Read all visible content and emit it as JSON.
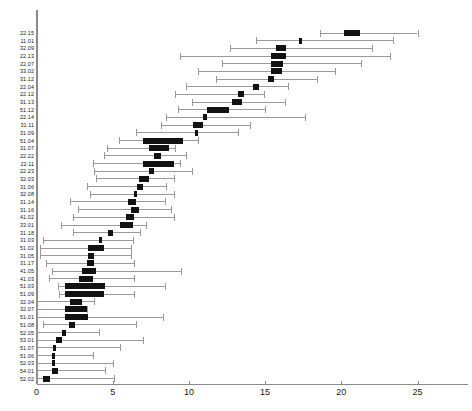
{
  "chart_data": {
    "type": "box",
    "title": "",
    "xlabel": "",
    "ylabel": "",
    "xlim": [
      0,
      28
    ],
    "xticks": [
      0,
      5,
      10,
      15,
      20,
      25
    ],
    "xtick_labels": [
      "0",
      "5",
      "10",
      "15",
      "20",
      "25"
    ],
    "grid": false,
    "legend": "none",
    "orientation": "horizontal",
    "n_groups": 45,
    "categories": [
      "22.15",
      "11.01",
      "32.09",
      "22.13",
      "22.07",
      "33.02",
      "31.12",
      "22.04",
      "22.12",
      "31.13",
      "51.12",
      "22.14",
      "31.11",
      "31.09",
      "51.04",
      "31.07",
      "22.22",
      "22.11",
      "22.23",
      "32.03",
      "31.06",
      "32.08",
      "31.14",
      "31.16",
      "41.02",
      "33.01",
      "31.18",
      "31.03",
      "51.02",
      "31.05",
      "31.17",
      "41.05",
      "41.03",
      "51.03",
      "51.09",
      "32.04",
      "32.07",
      "51.01",
      "51.08",
      "52.05",
      "53.01",
      "51.07",
      "51.06",
      "52.03",
      "54.01",
      "52.02"
    ],
    "boxes": [
      {
        "label": "22.15",
        "whisker_low": 18.6,
        "q1": 20.2,
        "median": 20.7,
        "q3": 21.2,
        "whisker_high": 25.0
      },
      {
        "label": "11.01",
        "whisker_low": 14.4,
        "q1": 17.2,
        "median": 17.3,
        "q3": 17.4,
        "whisker_high": 23.4
      },
      {
        "label": "32.09",
        "whisker_low": 12.7,
        "q1": 15.7,
        "median": 16.0,
        "q3": 16.4,
        "whisker_high": 22.0
      },
      {
        "label": "22.13",
        "whisker_low": 9.4,
        "q1": 15.4,
        "median": 15.9,
        "q3": 16.4,
        "whisker_high": 23.2
      },
      {
        "label": "22.07",
        "whisker_low": 12.2,
        "q1": 15.4,
        "median": 15.8,
        "q3": 16.2,
        "whisker_high": 21.3
      },
      {
        "label": "33.02",
        "whisker_low": 10.6,
        "q1": 15.4,
        "median": 15.7,
        "q3": 16.1,
        "whisker_high": 19.6
      },
      {
        "label": "31.12",
        "whisker_low": 11.8,
        "q1": 15.2,
        "median": 15.4,
        "q3": 15.6,
        "whisker_high": 18.4
      },
      {
        "label": "22.04",
        "whisker_low": 9.8,
        "q1": 14.2,
        "median": 14.4,
        "q3": 14.6,
        "whisker_high": 16.5
      },
      {
        "label": "22.12",
        "whisker_low": 9.1,
        "q1": 13.2,
        "median": 13.4,
        "q3": 13.6,
        "whisker_high": 14.9
      },
      {
        "label": "31.13",
        "whisker_low": 10.2,
        "q1": 12.8,
        "median": 13.1,
        "q3": 13.5,
        "whisker_high": 16.3
      },
      {
        "label": "51.12",
        "whisker_low": 9.3,
        "q1": 11.2,
        "median": 11.9,
        "q3": 12.6,
        "whisker_high": 15.0
      },
      {
        "label": "22.14",
        "whisker_low": 8.5,
        "q1": 10.9,
        "median": 11.0,
        "q3": 11.2,
        "whisker_high": 17.6
      },
      {
        "label": "31.11",
        "whisker_low": 8.2,
        "q1": 10.3,
        "median": 10.5,
        "q3": 10.9,
        "whisker_high": 14.0
      },
      {
        "label": "31.09",
        "whisker_low": 6.5,
        "q1": 10.4,
        "median": 10.5,
        "q3": 10.6,
        "whisker_high": 13.2
      },
      {
        "label": "51.04",
        "whisker_low": 5.4,
        "q1": 7.0,
        "median": 8.0,
        "q3": 9.6,
        "whisker_high": 10.6
      },
      {
        "label": "31.07",
        "whisker_low": 4.6,
        "q1": 7.4,
        "median": 8.0,
        "q3": 8.7,
        "whisker_high": 9.1
      },
      {
        "label": "22.22",
        "whisker_low": 4.4,
        "q1": 7.7,
        "median": 7.9,
        "q3": 8.2,
        "whisker_high": 9.8
      },
      {
        "label": "22.11",
        "whisker_low": 3.7,
        "q1": 7.0,
        "median": 7.6,
        "q3": 9.0,
        "whisker_high": 9.4
      },
      {
        "label": "22.23",
        "whisker_low": 3.8,
        "q1": 7.4,
        "median": 7.5,
        "q3": 7.7,
        "whisker_high": 10.2
      },
      {
        "label": "32.03",
        "whisker_low": 3.9,
        "q1": 6.7,
        "median": 7.0,
        "q3": 7.4,
        "whisker_high": 9.0
      },
      {
        "label": "31.06",
        "whisker_low": 3.3,
        "q1": 6.6,
        "median": 6.7,
        "q3": 7.0,
        "whisker_high": 8.5
      },
      {
        "label": "32.08",
        "whisker_low": 3.5,
        "q1": 6.4,
        "median": 6.5,
        "q3": 6.6,
        "whisker_high": 9.0
      },
      {
        "label": "31.14",
        "whisker_low": 2.2,
        "q1": 6.0,
        "median": 6.2,
        "q3": 6.5,
        "whisker_high": 8.4
      },
      {
        "label": "31.16",
        "whisker_low": 2.7,
        "q1": 6.2,
        "median": 6.4,
        "q3": 6.7,
        "whisker_high": 8.8
      },
      {
        "label": "41.02",
        "whisker_low": 2.4,
        "q1": 5.9,
        "median": 6.1,
        "q3": 6.4,
        "whisker_high": 9.0
      },
      {
        "label": "33.01",
        "whisker_low": 1.6,
        "q1": 5.5,
        "median": 5.9,
        "q3": 6.3,
        "whisker_high": 7.2
      },
      {
        "label": "31.18",
        "whisker_low": 2.4,
        "q1": 4.7,
        "median": 4.8,
        "q3": 5.0,
        "whisker_high": 6.8
      },
      {
        "label": "31.03",
        "whisker_low": 0.4,
        "q1": 4.1,
        "median": 4.2,
        "q3": 4.3,
        "whisker_high": 6.3
      },
      {
        "label": "51.02",
        "whisker_low": 0.2,
        "q1": 3.4,
        "median": 3.8,
        "q3": 4.4,
        "whisker_high": 6.2
      },
      {
        "label": "31.05",
        "whisker_low": 0.2,
        "q1": 3.4,
        "median": 3.6,
        "q3": 3.8,
        "whisker_high": 6.2
      },
      {
        "label": "31.17",
        "whisker_low": 0.6,
        "q1": 3.3,
        "median": 3.5,
        "q3": 3.8,
        "whisker_high": 6.4
      },
      {
        "label": "41.05",
        "whisker_low": 1.0,
        "q1": 3.0,
        "median": 3.4,
        "q3": 3.9,
        "whisker_high": 9.5
      },
      {
        "label": "41.03",
        "whisker_low": 0.8,
        "q1": 2.8,
        "median": 3.2,
        "q3": 3.7,
        "whisker_high": 6.4
      },
      {
        "label": "51.03",
        "whisker_low": 1.4,
        "q1": 1.9,
        "median": 3.0,
        "q3": 4.5,
        "whisker_high": 8.4
      },
      {
        "label": "51.09",
        "whisker_low": 1.5,
        "q1": 1.9,
        "median": 2.9,
        "q3": 4.4,
        "whisker_high": 6.4
      },
      {
        "label": "32.04",
        "whisker_low": 0.0,
        "q1": 2.2,
        "median": 2.5,
        "q3": 3.0,
        "whisker_high": 3.8
      },
      {
        "label": "32.07",
        "whisker_low": 0.0,
        "q1": 1.9,
        "median": 2.4,
        "q3": 3.3,
        "whisker_high": 3.3
      },
      {
        "label": "51.01",
        "whisker_low": 0.0,
        "q1": 1.9,
        "median": 2.4,
        "q3": 3.4,
        "whisker_high": 8.3
      },
      {
        "label": "51.08",
        "whisker_low": 0.4,
        "q1": 2.1,
        "median": 2.2,
        "q3": 2.5,
        "whisker_high": 6.5
      },
      {
        "label": "52.05",
        "whisker_low": 0.0,
        "q1": 1.7,
        "median": 1.8,
        "q3": 1.9,
        "whisker_high": 4.1
      },
      {
        "label": "53.01",
        "whisker_low": 0.0,
        "q1": 1.3,
        "median": 1.5,
        "q3": 1.7,
        "whisker_high": 7.0
      },
      {
        "label": "51.07",
        "whisker_low": 0.0,
        "q1": 1.1,
        "median": 1.2,
        "q3": 1.3,
        "whisker_high": 5.5
      },
      {
        "label": "51.06",
        "whisker_low": 0.0,
        "q1": 1.0,
        "median": 1.1,
        "q3": 1.2,
        "whisker_high": 3.7
      },
      {
        "label": "52.03",
        "whisker_low": 0.0,
        "q1": 1.0,
        "median": 1.1,
        "q3": 1.2,
        "whisker_high": 5.0
      },
      {
        "label": "54.01",
        "whisker_low": 0.0,
        "q1": 1.0,
        "median": 1.2,
        "q3": 1.4,
        "whisker_high": 4.5
      },
      {
        "label": "52.02",
        "whisker_low": 0.0,
        "q1": 0.4,
        "median": 0.6,
        "q3": 0.9,
        "whisker_high": 5.1
      }
    ],
    "colors": {
      "box_fill": "#121212",
      "whisker": "#9a9a9a",
      "axis": "#8a8a8a",
      "text": "#1a1a1a",
      "background": "#ffffff"
    }
  }
}
